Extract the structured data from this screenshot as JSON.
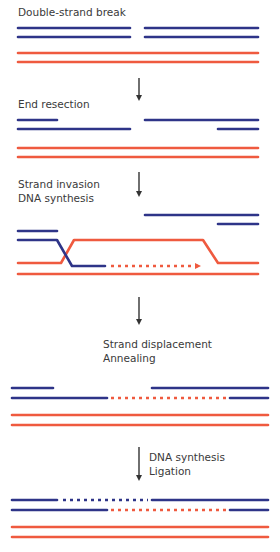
{
  "diagram": {
    "colors": {
      "blue": "#2e3488",
      "red": "#ef5a3f",
      "arrow": "#333333",
      "text": "#3a3a3a"
    },
    "steps": [
      {
        "id": "double-strand-break",
        "label_lines": [
          "Double-strand break"
        ]
      },
      {
        "id": "end-resection",
        "label_lines": [
          "End resection"
        ]
      },
      {
        "id": "strand-invasion",
        "label_lines": [
          "Strand invasion",
          "DNA synthesis"
        ]
      },
      {
        "id": "strand-displacement",
        "label_lines": [
          "Strand displacement",
          "Annealing"
        ]
      },
      {
        "id": "dna-synthesis-ligation",
        "label_lines": [
          "DNA synthesis",
          "Ligation"
        ]
      }
    ]
  }
}
